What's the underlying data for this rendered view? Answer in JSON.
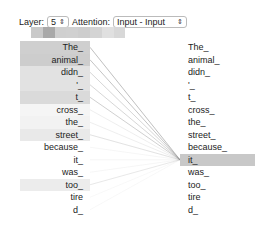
{
  "controls": {
    "layer_label": "Layer:",
    "layer_value": "5",
    "attention_label": "Attention:",
    "attention_value": "Input - Input"
  },
  "head_colors": [
    "#c9c9c9",
    "#a9a9a9",
    "#cfcfcf",
    "#d0d0d0",
    "#cdcdcd",
    "#d4d4d4",
    "#e0e0e0",
    "#d8d8d8"
  ],
  "left_tokens": [
    {
      "text": "The_",
      "bg": "#cfcfcf"
    },
    {
      "text": "animal_",
      "bg": "#cdcdcd"
    },
    {
      "text": "didn_",
      "bg": "#e2e2e2"
    },
    {
      "text": "'_",
      "bg": "#e2e2e2"
    },
    {
      "text": "t_",
      "bg": "#dadada"
    },
    {
      "text": "cross_",
      "bg": "#f5f5f5"
    },
    {
      "text": "the_",
      "bg": "#f2f2f2"
    },
    {
      "text": "street_",
      "bg": "#e9e9e9"
    },
    {
      "text": "because_",
      "bg": "#ffffff"
    },
    {
      "text": "it_",
      "bg": "#ffffff"
    },
    {
      "text": "was_",
      "bg": "#ffffff"
    },
    {
      "text": "too_",
      "bg": "#ececec"
    },
    {
      "text": "tire",
      "bg": "#ffffff"
    },
    {
      "text": "d_",
      "bg": "#ffffff"
    }
  ],
  "right_tokens": [
    {
      "text": "The_",
      "bg": "#ffffff"
    },
    {
      "text": "animal_",
      "bg": "#ffffff"
    },
    {
      "text": "didn_",
      "bg": "#ffffff"
    },
    {
      "text": "'_",
      "bg": "#ffffff"
    },
    {
      "text": "t_",
      "bg": "#ffffff"
    },
    {
      "text": "cross_",
      "bg": "#ffffff"
    },
    {
      "text": "the_",
      "bg": "#ffffff"
    },
    {
      "text": "street_",
      "bg": "#ffffff"
    },
    {
      "text": "because_",
      "bg": "#ffffff"
    },
    {
      "text": "it_",
      "bg": "#c8c8c8"
    },
    {
      "text": "was_",
      "bg": "#ffffff"
    },
    {
      "text": "too_",
      "bg": "#ffffff"
    },
    {
      "text": "tire",
      "bg": "#ffffff"
    },
    {
      "text": "d_",
      "bg": "#ffffff"
    }
  ],
  "selected_right_index": 9,
  "line_opacities": [
    0.55,
    0.5,
    0.35,
    0.35,
    0.4,
    0.15,
    0.15,
    0.25,
    0.08,
    0.08,
    0.08,
    0.2,
    0.06,
    0.06
  ]
}
